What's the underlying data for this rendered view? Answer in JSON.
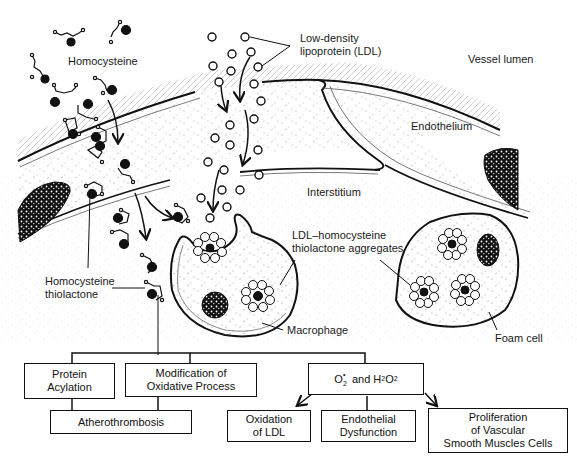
{
  "diagram": {
    "regions": {
      "vessel_lumen": "Vessel lumen",
      "endothelium": "Endothelium",
      "interstitium": "Interstitium"
    },
    "labels": {
      "homocysteine": "Homocysteine",
      "ldl_line1": "Low-density",
      "ldl_line2": "lipoprotein (LDL)",
      "thiolactone_line1": "Homocysteine",
      "thiolactone_line2": "thiolactone",
      "aggregates_line1": "LDL–homocysteine",
      "aggregates_line2": "thiolactone aggregates",
      "macrophage": "Macrophage",
      "foam_cell": "Foam cell"
    },
    "flowchart": {
      "protein_acylation": {
        "line1": "Protein",
        "line2": "Acylation"
      },
      "modification": {
        "line1": "Modification of",
        "line2": "Oxidative Process"
      },
      "atherothrombosis": "Atherothrombosis",
      "ros": {
        "o2": "O",
        "o2_sub": "2",
        "o2_sup": "•",
        "and": " and H",
        "h2o2_sub1": "2",
        "o": "O",
        "h2o2_sub2": "2"
      },
      "oxidation_ldl": {
        "line1": "Oxidation",
        "line2": "of LDL"
      },
      "endothelial": {
        "line1": "Endothelial",
        "line2": "Dysfunction"
      },
      "proliferation": {
        "line1": "Proliferation",
        "line2": "of Vascular",
        "line3": "Smooth Muscles Cells"
      }
    },
    "colors": {
      "ink": "#111111",
      "background": "#ffffff",
      "stipple": "#9a9a9a"
    }
  }
}
